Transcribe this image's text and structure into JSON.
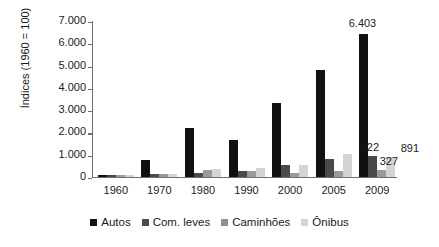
{
  "chart_data": {
    "type": "bar",
    "title": "",
    "subtitle": "",
    "xlabel": "",
    "ylabel": "Índices (1960 = 100)",
    "ylim": [
      0,
      7000
    ],
    "ytick_labels": [
      "0",
      "1.000",
      "2.000",
      "3.000",
      "4.000",
      "5.000",
      "6.000",
      "7.000"
    ],
    "ytick_values": [
      0,
      1000,
      2000,
      3000,
      4000,
      5000,
      6000,
      7000
    ],
    "grid": false,
    "legend_position": "bottom",
    "categories": [
      "1960",
      "1970",
      "1980",
      "1990",
      "2000",
      "2005",
      "2009"
    ],
    "series": [
      {
        "name": "Autos",
        "color": "#111111",
        "values": [
          100,
          760,
          2200,
          1650,
          3300,
          4800,
          6403
        ]
      },
      {
        "name": "Com. leves",
        "color": "#4a4a4a",
        "values": [
          100,
          130,
          200,
          250,
          520,
          830,
          922
        ]
      },
      {
        "name": "Caminhões",
        "color": "#9a9a9a",
        "values": [
          100,
          120,
          300,
          260,
          170,
          290,
          327
        ]
      },
      {
        "name": "Ônibus",
        "color": "#d4d4d4",
        "values": [
          100,
          150,
          380,
          400,
          560,
          1030,
          891
        ]
      }
    ],
    "data_labels": [
      {
        "text": "6.403",
        "series": "Autos",
        "category": "2009"
      },
      {
        "text": "922",
        "series": "Com. leves",
        "category": "2009"
      },
      {
        "text": "327",
        "series": "Caminhões",
        "category": "2009"
      },
      {
        "text": "891",
        "series": "Ônibus",
        "category": "2009"
      }
    ]
  }
}
